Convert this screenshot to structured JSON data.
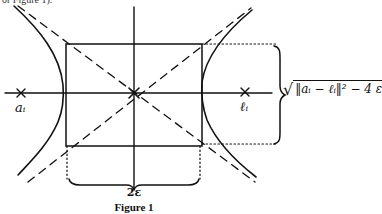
{
  "top_fragment": "or Figure 1).",
  "labels": {
    "left_focus": "aᵢ",
    "right_focus": "ℓᵢ",
    "width": "2ε",
    "height_formula_prefix": "√",
    "height_formula_body": "‖aᵢ − ℓᵢ‖² − 4 ε"
  },
  "caption": "Figure 1",
  "colors": {
    "ink": "#111111",
    "background": "#ffffff"
  }
}
